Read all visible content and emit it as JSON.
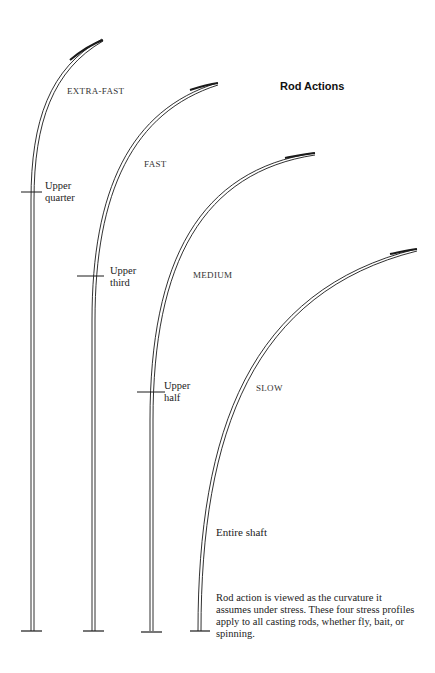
{
  "title": "Rod Actions",
  "rods": [
    {
      "action": "EXTRA-FAST",
      "flex_label_line1": "Upper",
      "flex_label_line2": "quarter"
    },
    {
      "action": "FAST",
      "flex_label_line1": "Upper",
      "flex_label_line2": "third"
    },
    {
      "action": "MEDIUM",
      "flex_label_line1": "Upper",
      "flex_label_line2": "half"
    },
    {
      "action": "SLOW",
      "flex_label_line1": "Entire shaft",
      "flex_label_line2": ""
    }
  ],
  "caption": "Rod action is viewed as the curvature it assumes under stress. These four stress profiles apply to all casting rods, whether fly, bait, or spinning.",
  "colors": {
    "line": "#1a1a1a",
    "background": "#ffffff"
  }
}
